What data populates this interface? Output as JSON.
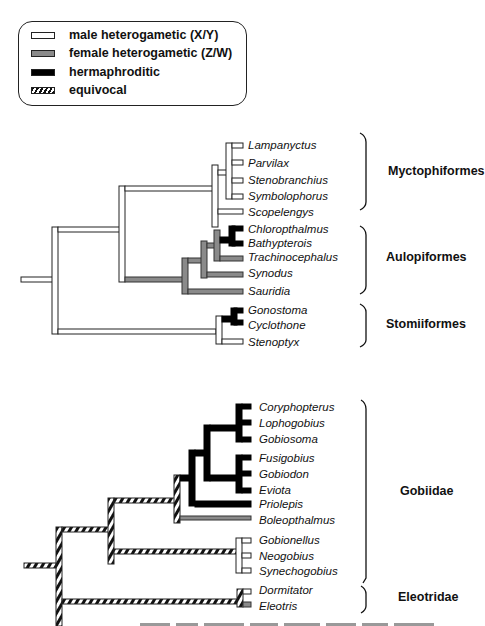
{
  "legend": {
    "items": [
      {
        "label": "male heterogametic (X/Y)",
        "state": "male",
        "color": "#ffffff"
      },
      {
        "label": "female heterogametic (Z/W)",
        "state": "female",
        "color": "#8a8a8a"
      },
      {
        "label": "hermaphroditic",
        "state": "herm",
        "color": "#000000"
      },
      {
        "label": "equivocal",
        "state": "equivocal",
        "color": "hatched"
      }
    ]
  },
  "trees": [
    {
      "name": "upper-tree",
      "taxa": [
        {
          "name": "Lampanyctus",
          "state": "male"
        },
        {
          "name": "Parvilax",
          "state": "male"
        },
        {
          "name": "Stenobranchius",
          "state": "male"
        },
        {
          "name": "Symbolophorus",
          "state": "male"
        },
        {
          "name": "Scopelengys",
          "state": "male"
        },
        {
          "name": "Chloropthalmus",
          "state": "herm"
        },
        {
          "name": "Bathypterois",
          "state": "herm"
        },
        {
          "name": "Trachinocephalus",
          "state": "female"
        },
        {
          "name": "Synodus",
          "state": "female"
        },
        {
          "name": "Sauridia",
          "state": "female"
        },
        {
          "name": "Gonostoma",
          "state": "herm"
        },
        {
          "name": "Cyclothone",
          "state": "herm"
        },
        {
          "name": "Stenoptyx",
          "state": "male"
        }
      ],
      "clades": [
        {
          "label": "Myctophiformes"
        },
        {
          "label": "Aulopiformes"
        },
        {
          "label": "Stomiiformes"
        }
      ]
    },
    {
      "name": "lower-tree",
      "taxa": [
        {
          "name": "Coryphopterus",
          "state": "herm"
        },
        {
          "name": "Lophogobius",
          "state": "herm"
        },
        {
          "name": "Gobiosoma",
          "state": "herm"
        },
        {
          "name": "Fusigobius",
          "state": "herm"
        },
        {
          "name": "Gobiodon",
          "state": "herm"
        },
        {
          "name": "Eviota",
          "state": "herm"
        },
        {
          "name": "Priolepis",
          "state": "herm"
        },
        {
          "name": "Boleopthalmus",
          "state": "female"
        },
        {
          "name": "Gobionellus",
          "state": "male"
        },
        {
          "name": "Neogobius",
          "state": "male"
        },
        {
          "name": "Synechogobius",
          "state": "male"
        },
        {
          "name": "Dormitator",
          "state": "male"
        },
        {
          "name": "Eleotris",
          "state": "female"
        }
      ],
      "clades": [
        {
          "label": "Gobiidae"
        },
        {
          "label": "Eleotridae"
        }
      ]
    }
  ]
}
